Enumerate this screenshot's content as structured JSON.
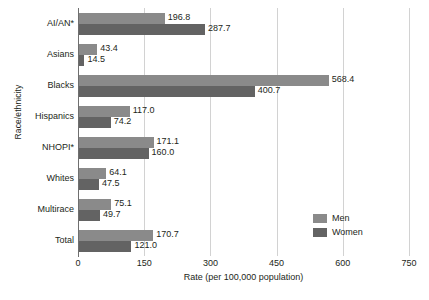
{
  "chart_data": {
    "type": "bar",
    "orientation": "horizontal",
    "title": "",
    "xlabel": "Rate (per 100,000 population)",
    "ylabel": "Race/ethnicity",
    "xlim": [
      0,
      750
    ],
    "xticks": [
      0,
      150,
      300,
      450,
      600,
      750
    ],
    "grid": true,
    "legend_position": "right-middle",
    "categories": [
      "AI/AN*",
      "Asians",
      "Blacks",
      "Hispanics",
      "NHOPI*",
      "Whites",
      "Multirace",
      "Total"
    ],
    "series": [
      {
        "name": "Men",
        "color": "#8a8a8a",
        "values": [
          196.8,
          43.4,
          568.4,
          117.0,
          171.1,
          64.1,
          75.1,
          170.7
        ]
      },
      {
        "name": "Women",
        "color": "#636363",
        "values": [
          287.7,
          14.5,
          400.7,
          74.2,
          160.0,
          47.5,
          49.7,
          121.0
        ]
      }
    ],
    "data_labels": {
      "men": [
        "196.8",
        "43.4",
        "568.4",
        "117.0",
        "171.1",
        "64.1",
        "75.1",
        "170.7"
      ],
      "women": [
        "287.7",
        "14.5",
        "400.7",
        "74.2",
        "160.0",
        "47.5",
        "49.7",
        "121.0"
      ]
    }
  }
}
